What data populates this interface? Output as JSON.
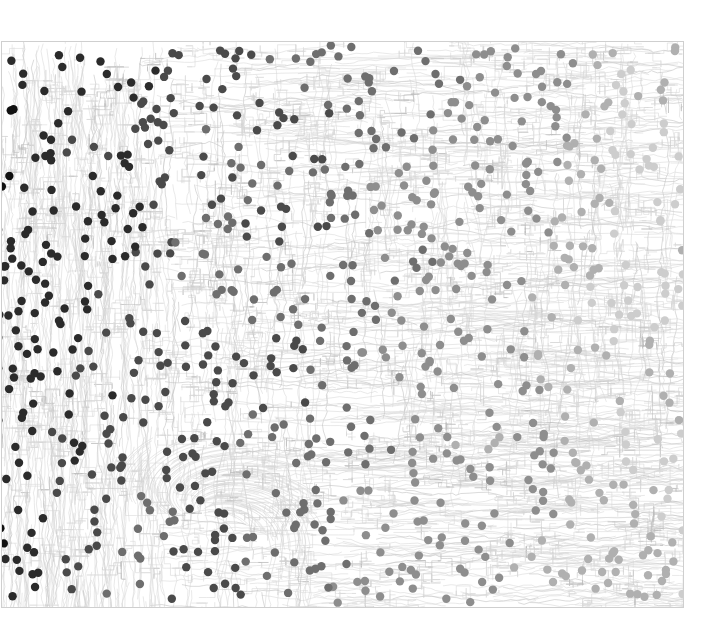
{
  "figure": {
    "title": "",
    "type": "dot-density-map-over-contours",
    "width": 704,
    "height": 643,
    "background_color": "#ffffff"
  },
  "map_frame": {
    "name": "map-plot-frame",
    "x": 1,
    "y": 41,
    "width": 682,
    "height": 566,
    "stroke_color": "#cfcfcf",
    "stroke_width": 1,
    "note": "content bleeds past left edge (cropped)"
  },
  "contour_layer": {
    "name": "contour-lines",
    "stroke_color": "#d6d6d6",
    "stroke_color_dark": "#bdbdbd",
    "stroke_width": 0.55,
    "line_count": 2300,
    "description": "dense fine topographic / isoline texture filling the plot area, with a fan-shaped ridge cluster near lower-left-center and strong vertical striations along the left margin"
  },
  "dot_layer": {
    "name": "scatter-dots",
    "count": 860,
    "radius_px": 4.2,
    "color_scale": [
      "#111111",
      "#2b2b2b",
      "#4a4a4a",
      "#6e6e6e",
      "#8e8e8e",
      "#b0b0b0",
      "#cdcdcd",
      "#e2e2e2"
    ],
    "description": "grayscale point markers; darker and denser toward the left/lower-left, lighter toward the right/lower-right"
  },
  "chart_data": {
    "type": "scatter",
    "title": "",
    "subtitle": "",
    "xlabel": "",
    "ylabel": "",
    "xlim": [
      0,
      1
    ],
    "ylim": [
      0,
      1
    ],
    "grid": false,
    "legend": null,
    "tick_labels_x": [],
    "tick_labels_y": [],
    "annotations": [],
    "series": [
      {
        "name": "points",
        "marker": "circle",
        "marker_size_px": 8.4,
        "encoding": "grayscale value encodes magnitude; dark = high, light = low",
        "n_points": 860,
        "value_range": [
          0.0,
          1.0
        ],
        "spatial_trend": "values decrease from left (dark) to right (light)"
      },
      {
        "name": "contours",
        "marker": "line",
        "stroke": "#d6d6d6",
        "n_lines": 2300,
        "encoding": "background isoline field"
      }
    ]
  }
}
